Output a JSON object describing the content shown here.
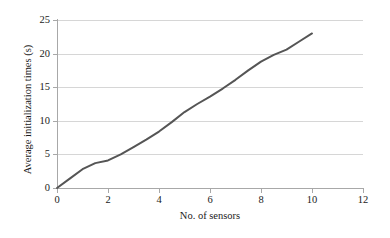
{
  "chart_data": {
    "type": "line",
    "title": "",
    "subtitle": "",
    "xlabel": "No. of sensors",
    "ylabel": "Average initialization times (s)",
    "xlim": [
      0,
      12
    ],
    "ylim": [
      0,
      25
    ],
    "xticks": [
      0,
      2,
      4,
      6,
      8,
      10,
      12
    ],
    "yticks": [
      0,
      5,
      10,
      15,
      20,
      25
    ],
    "xtick_labels": [
      "0",
      "2",
      "4",
      "6",
      "8",
      "10",
      "12"
    ],
    "ytick_labels": [
      "0",
      "5",
      "10",
      "15",
      "20",
      "25"
    ],
    "grid": "horizontal",
    "legend": "none",
    "series": [
      {
        "name": "Average initialization times",
        "color": "#555555",
        "line_width": 2,
        "markers": "none",
        "x": [
          0,
          0.5,
          1,
          1.5,
          2,
          2.5,
          3,
          3.5,
          4,
          4.5,
          5,
          5.5,
          6,
          6.5,
          7,
          7.5,
          8,
          8.5,
          9,
          9.5,
          10
        ],
        "y": [
          0,
          1.4,
          2.8,
          3.7,
          4.1,
          5.0,
          6.1,
          7.2,
          8.4,
          9.8,
          11.3,
          12.5,
          13.6,
          14.8,
          16.1,
          17.5,
          18.8,
          19.8,
          20.6,
          21.8,
          23.0
        ]
      }
    ],
    "grid_color": "#d6d6d6",
    "axis_color": "#a8a8a8",
    "background": "#ffffff"
  }
}
